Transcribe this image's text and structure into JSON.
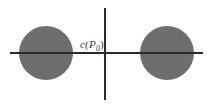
{
  "figure": {
    "type": "math-diagram",
    "width": 211,
    "height": 108,
    "background_color": "#ffffff",
    "axis_color": "#2b2b2b",
    "disk_fill_color": "#6e6e6e",
    "label_color": "#3a3a3a"
  },
  "axes": {
    "horizontal": {
      "name": "horizontal-axis",
      "x_start": 10,
      "x_end": 203,
      "y": 53
    },
    "vertical": {
      "name": "vertical-axis",
      "x": 105,
      "y_start": 8,
      "y_end": 100
    },
    "origin": {
      "x": 105,
      "y": 53
    }
  },
  "disks": [
    {
      "name": "left-disk",
      "center_x": 46,
      "center_y": 53,
      "radius": 27,
      "fill": "#6e6e6e"
    },
    {
      "name": "right-disk",
      "center_x": 167,
      "center_y": 53,
      "radius": 27,
      "fill": "#6e6e6e"
    }
  ],
  "labels": {
    "origin_label": {
      "text": "c(P",
      "subscript": "0",
      "closing": ")",
      "full_text": "c(P₀)",
      "x": 80,
      "y": 38
    }
  }
}
